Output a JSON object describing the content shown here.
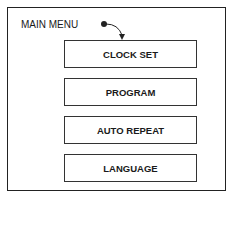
{
  "menu": {
    "title": "MAIN MENU",
    "items": [
      {
        "label": "CLOCK SET",
        "selected": true
      },
      {
        "label": "PROGRAM"
      },
      {
        "label": "AUTO REPEAT"
      },
      {
        "label": "LANGUAGE"
      }
    ]
  },
  "cursor": {
    "icon": "pointer-arrow-icon",
    "target": "CLOCK SET"
  }
}
